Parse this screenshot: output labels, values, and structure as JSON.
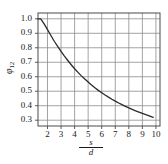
{
  "chart_data": {
    "type": "line",
    "title": "",
    "subtitle": "",
    "xlabel": "s/d",
    "xlabel_numerator": "s",
    "xlabel_denominator": "d",
    "ylabel": "φ",
    "ylabel_subscript": "12",
    "xlim": [
      1.3,
      10.3
    ],
    "ylim": [
      0.26,
      1.04
    ],
    "xticks": [
      2,
      3,
      4,
      5,
      6,
      7,
      8,
      9,
      10
    ],
    "xtick_labels": [
      "2",
      "3",
      "4",
      "5",
      "6",
      "7",
      "8",
      "9",
      "10"
    ],
    "yticks": [
      0.3,
      0.4,
      0.5,
      0.6,
      0.7,
      0.8,
      0.9,
      1.0
    ],
    "ytick_labels": [
      "0.3",
      "0.4",
      "0.5",
      "0.6",
      "0.7",
      "0.8",
      "0.9",
      "1.0"
    ],
    "grid": true,
    "legend": "none",
    "line_color": "#2b2b2b",
    "grid_color": "#8d8d8d",
    "frame_color": "#4a4a4a",
    "background": "#ffffff",
    "series": [
      {
        "name": "φ12",
        "x": [
          1.3,
          1.5,
          1.75,
          2.0,
          2.25,
          2.5,
          2.75,
          3.0,
          3.25,
          3.5,
          3.75,
          4.0,
          4.25,
          4.5,
          4.75,
          5.0,
          5.25,
          5.5,
          5.75,
          6.0,
          6.25,
          6.5,
          6.75,
          7.0,
          7.25,
          7.5,
          7.75,
          8.0,
          8.25,
          8.5,
          8.75,
          9.0,
          9.25,
          9.5,
          9.8
        ],
        "y": [
          1.0,
          1.0,
          0.965,
          0.925,
          0.885,
          0.845,
          0.81,
          0.775,
          0.742,
          0.712,
          0.683,
          0.655,
          0.63,
          0.606,
          0.584,
          0.563,
          0.543,
          0.524,
          0.506,
          0.49,
          0.474,
          0.459,
          0.445,
          0.432,
          0.419,
          0.407,
          0.396,
          0.385,
          0.375,
          0.365,
          0.356,
          0.347,
          0.338,
          0.33,
          0.32
        ]
      }
    ]
  },
  "axis": {
    "plot_left_px": 38,
    "plot_right_px": 160,
    "plot_top_px": 13,
    "plot_bottom_px": 126
  }
}
